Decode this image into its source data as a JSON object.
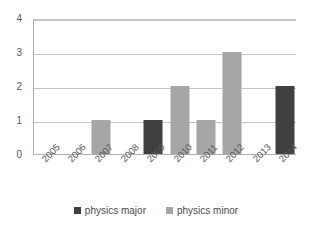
{
  "chart_data": {
    "type": "bar",
    "title": "",
    "xlabel": "",
    "ylabel": "",
    "categories": [
      "2005",
      "2006",
      "2007",
      "2008",
      "2009",
      "2010",
      "2011",
      "2012",
      "2013",
      "2014"
    ],
    "series": [
      {
        "name": "physics major",
        "color": "#404040",
        "values": [
          0,
          0,
          0,
          0,
          1,
          0,
          0,
          0,
          0,
          2
        ]
      },
      {
        "name": "physics minor",
        "color": "#a6a6a6",
        "values": [
          0,
          0,
          1,
          0,
          0,
          2,
          1,
          3,
          0,
          0
        ]
      }
    ],
    "ylim": [
      0,
      4
    ],
    "ytick_labels": [
      "0",
      "1",
      "2",
      "3",
      "4"
    ],
    "ytick_values": [
      0,
      1,
      2,
      3,
      4
    ],
    "grid": true,
    "grid_axis": "y",
    "legend_position": "bottom-center",
    "bar_mode": "overlay"
  },
  "legend": {
    "items": [
      {
        "label": "physics major",
        "swatch": "legend-swatch-major"
      },
      {
        "label": "physics minor",
        "swatch": "legend-swatch-minor"
      }
    ]
  }
}
